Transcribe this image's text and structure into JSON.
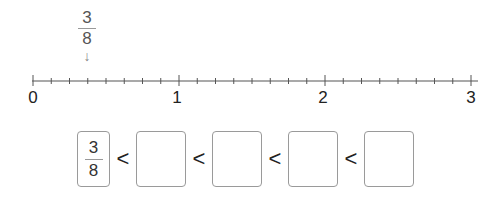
{
  "number_line": {
    "start": 0,
    "end": 3,
    "subdivisions_per_unit": 8,
    "labels": [
      "0",
      "1",
      "2",
      "3"
    ],
    "marked_fraction": {
      "numerator": "3",
      "denominator": "8",
      "value": 0.375
    }
  },
  "comparison_row": {
    "first": {
      "numerator": "3",
      "denominator": "8"
    },
    "operator": "<",
    "blank_boxes": 4
  }
}
